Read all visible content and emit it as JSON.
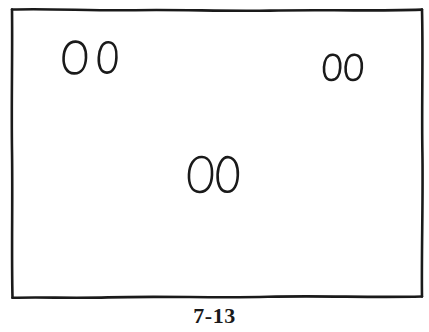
{
  "figure": {
    "kind": "hand-drawn-line-drawing",
    "caption": "7-13",
    "background_color": "#ffffff",
    "ink_color": "#1a1a1a",
    "frame": {
      "name": "panel-border",
      "style": "hand-drawn wavy rectangle",
      "x": 11,
      "y": 8,
      "width": 412,
      "height": 290,
      "stroke_width": 2.6
    },
    "oval_pairs": [
      {
        "name": "oval-pair-upper-left",
        "position": "upper-left",
        "count": 2,
        "ovals": [
          {
            "name": "oval-upper-left-a",
            "cx": 74.5,
            "cy": 57.5,
            "rx": 11.0,
            "ry": 16.0,
            "rotation": -6
          },
          {
            "name": "oval-upper-left-b",
            "cx": 107.5,
            "cy": 57.5,
            "rx": 9.0,
            "ry": 15.5,
            "rotation": -4
          }
        ]
      },
      {
        "name": "oval-pair-upper-right",
        "position": "upper-right",
        "count": 2,
        "ovals": [
          {
            "name": "oval-upper-right-a",
            "cx": 332.0,
            "cy": 67.5,
            "rx": 8.5,
            "ry": 12.8,
            "rotation": -3
          },
          {
            "name": "oval-upper-right-b",
            "cx": 353.5,
            "cy": 67.5,
            "rx": 8.5,
            "ry": 12.8,
            "rotation": -3
          }
        ]
      },
      {
        "name": "oval-pair-center",
        "position": "center",
        "count": 2,
        "ovals": [
          {
            "name": "oval-center-a",
            "cx": 200.5,
            "cy": 174.5,
            "rx": 11.5,
            "ry": 17.5,
            "rotation": -5
          },
          {
            "name": "oval-center-b",
            "cx": 227.5,
            "cy": 174.5,
            "rx": 10.5,
            "ry": 17.5,
            "rotation": -4
          }
        ]
      }
    ]
  }
}
